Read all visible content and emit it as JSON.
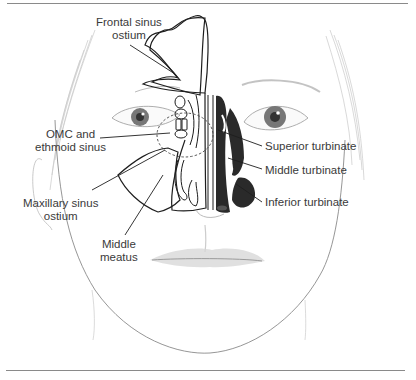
{
  "figure": {
    "labels": {
      "frontal_sinus_ostium": [
        "Frontal sinus",
        "ostium"
      ],
      "omc_ethmoid": [
        "OMC and",
        "ethmoid sinus"
      ],
      "maxillary_sinus_ostium": [
        "Maxillary sinus",
        "ostium"
      ],
      "middle_meatus": [
        "Middle",
        "meatus"
      ],
      "superior_turbinate": "Superior turbinate",
      "middle_turbinate": "Middle turbinate",
      "inferior_turbinate": "Inferior turbinate"
    },
    "colors": {
      "line": "#1e1e1e",
      "label_text": "#3a3a3a",
      "turbinate_fill": "#2a2a2a",
      "rule": "#8a8a8a"
    }
  }
}
